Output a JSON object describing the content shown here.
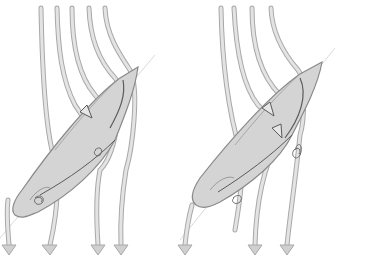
{
  "figure": {
    "description": "Two side-by-side sketches of airflow streamlines passing over a car viewed from above at an angle, with vortices shed behind",
    "panels": [
      {
        "id": "left",
        "streamlines": 5,
        "vortices": 2
      },
      {
        "id": "right",
        "streamlines": 4,
        "vortices": 2
      }
    ],
    "colors": {
      "background": "#ffffff",
      "streamline_fill": "#d9d9d9",
      "streamline_edge": "#a8a8a8",
      "car_fill": "#d4d4d4",
      "car_edge": "#8a8a8a",
      "detail_line": "#5a5a5a"
    }
  }
}
